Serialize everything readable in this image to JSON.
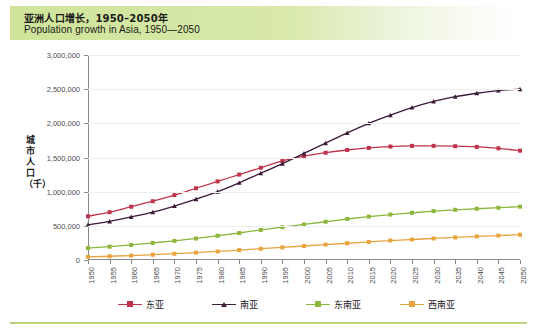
{
  "header": {
    "title_cn": "亚洲人口增长，1950–2050年",
    "title_en": "Population growth in Asia, 1950—2050"
  },
  "chart_data": {
    "type": "line",
    "xlabel": "",
    "ylabel": "城市人口（千）",
    "ylim": [
      0,
      3000000
    ],
    "ytick_labels": [
      "3,000,000",
      "2,500,000",
      "2,000,000",
      "1,500,000",
      "1,000,000",
      "500,000",
      "0"
    ],
    "ytick_values": [
      3000000,
      2500000,
      2000000,
      1500000,
      1000000,
      500000,
      0
    ],
    "grid": true,
    "legend_position": "bottom",
    "categories": [
      "1950",
      "1955",
      "1960",
      "1965",
      "1970",
      "1975",
      "1980",
      "1985",
      "1990",
      "1995",
      "2000",
      "2005",
      "2010",
      "2015",
      "2020",
      "2025",
      "2030",
      "2035",
      "2040",
      "2045",
      "2050"
    ],
    "series": [
      {
        "name": "东亚",
        "color": "#c0334d",
        "marker": "square",
        "values": [
          640000,
          700000,
          780000,
          860000,
          950000,
          1050000,
          1150000,
          1250000,
          1350000,
          1450000,
          1520000,
          1570000,
          1610000,
          1640000,
          1660000,
          1670000,
          1670000,
          1665000,
          1655000,
          1635000,
          1600000
        ]
      },
      {
        "name": "南亚",
        "color": "#3b1b38",
        "marker": "triangle",
        "values": [
          515000,
          565000,
          630000,
          700000,
          790000,
          890000,
          1000000,
          1130000,
          1270000,
          1410000,
          1560000,
          1710000,
          1860000,
          2000000,
          2120000,
          2230000,
          2320000,
          2390000,
          2440000,
          2480000,
          2500000
        ]
      },
      {
        "name": "东南亚",
        "color": "#8cb63c",
        "marker": "square",
        "values": [
          175000,
          195000,
          220000,
          250000,
          280000,
          315000,
          355000,
          395000,
          440000,
          480000,
          520000,
          560000,
          600000,
          635000,
          665000,
          690000,
          715000,
          735000,
          750000,
          765000,
          780000
        ]
      },
      {
        "name": "西南亚",
        "color": "#e8a33d",
        "marker": "square",
        "values": [
          45000,
          55000,
          65000,
          78000,
          92000,
          108000,
          125000,
          145000,
          165000,
          185000,
          205000,
          225000,
          245000,
          265000,
          285000,
          300000,
          315000,
          330000,
          345000,
          358000,
          370000
        ]
      }
    ]
  }
}
